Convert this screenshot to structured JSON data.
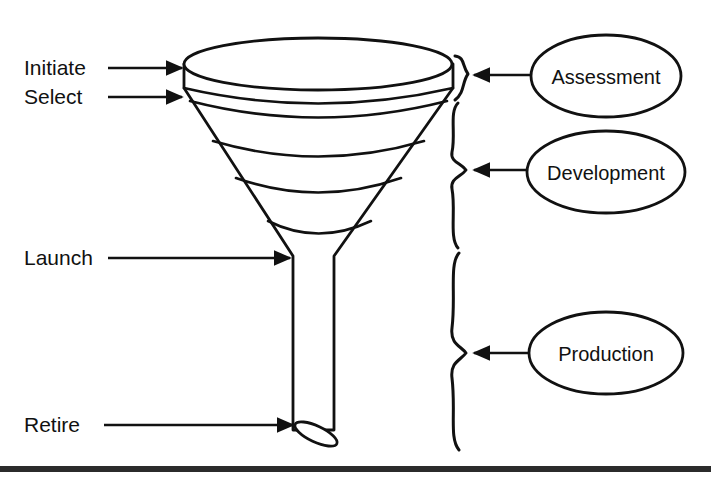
{
  "figure": {
    "type": "funnel-lifecycle-diagram",
    "background_color": "#ffffff",
    "line_color": "#111111",
    "footer_bar_color": "#2b2b2b"
  },
  "stage_labels": [
    {
      "id": "initiate",
      "text": "Initiate",
      "x": 24,
      "y": 75,
      "arrow_from_x": 108,
      "arrow_to_x": 184,
      "arrow_y": 68
    },
    {
      "id": "select",
      "text": "Select",
      "x": 24,
      "y": 104,
      "arrow_from_x": 108,
      "arrow_to_x": 184,
      "arrow_y": 97
    },
    {
      "id": "launch",
      "text": "Launch",
      "x": 24,
      "y": 265,
      "arrow_from_x": 108,
      "arrow_to_x": 292,
      "arrow_y": 258
    },
    {
      "id": "retire",
      "text": "Retire",
      "x": 24,
      "y": 432,
      "arrow_from_x": 104,
      "arrow_to_x": 295,
      "arrow_y": 425
    }
  ],
  "phases": [
    {
      "id": "assessment",
      "label": "Assessment",
      "oval": {
        "cx": 606,
        "cy": 76,
        "rx": 75,
        "ry": 41
      },
      "brace": {
        "top_y": 56,
        "bottom_y": 100,
        "tip_y": 76,
        "x": 455
      },
      "arrow": {
        "from_x": 528,
        "to_x": 472,
        "y": 76
      }
    },
    {
      "id": "development",
      "label": "Development",
      "oval": {
        "cx": 606,
        "cy": 172,
        "rx": 79,
        "ry": 41
      },
      "brace": {
        "top_y": 102,
        "bottom_y": 248,
        "tip_y": 170,
        "x": 455
      },
      "arrow": {
        "from_x": 526,
        "to_x": 472,
        "y": 170
      }
    },
    {
      "id": "production",
      "label": "Production",
      "oval": {
        "cx": 606,
        "cy": 353,
        "rx": 77,
        "ry": 41
      },
      "brace": {
        "top_y": 253,
        "bottom_y": 450,
        "tip_y": 353,
        "x": 455
      },
      "arrow": {
        "from_x": 528,
        "to_x": 472,
        "y": 353
      }
    }
  ],
  "funnel": {
    "rim": {
      "cx": 318,
      "cy": 64,
      "rx": 134,
      "ry": 26
    },
    "rim_band_bottom_y": 92,
    "cone_top_left_x": 184,
    "cone_top_right_x": 453,
    "cone_bottom_y": 256,
    "stem": {
      "left_x": 293,
      "right_x": 334,
      "top_y": 256,
      "bottom_y": 432
    },
    "band_arc_y_positions": [
      92,
      115,
      154,
      190,
      232
    ],
    "spout_ellipse": {
      "cx": 316,
      "cy": 433,
      "rx": 21,
      "ry": 7,
      "rotation_deg": 25
    }
  },
  "footer": {
    "bar_y": 466,
    "bar_height": 6
  }
}
